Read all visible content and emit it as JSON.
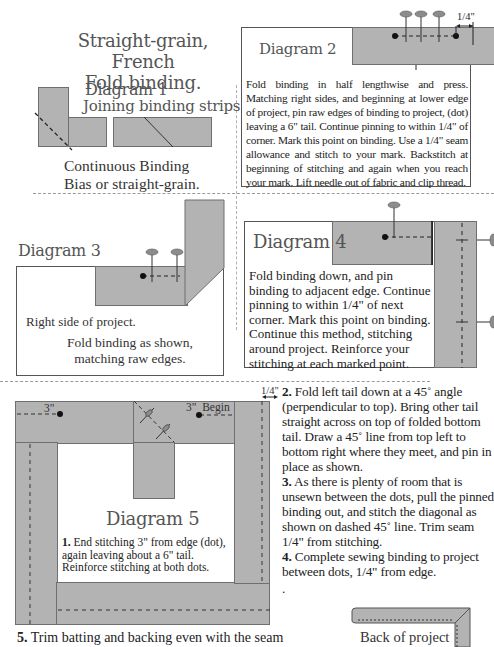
{
  "page": {
    "title_line1": "Straight-grain, French",
    "title_line2": "Fold  binding."
  },
  "diagram1": {
    "title": "Diagram 1",
    "subtitle": "Joining binding strips.",
    "caption_line1": "Continuous Binding",
    "caption_line2": "Bias or straight-grain."
  },
  "diagram2": {
    "title": "Diagram 2",
    "measure_label": "1/4\"",
    "text": "Fold binding in half lengthwise and press.  Matching right sides, and beginning at lower edge of project, pin raw edges of binding to project, (dot) leaving a 6\" tail.  Continue pinning to within 1/4\" of corner.  Mark this point on binding.  Use a 1/4\" seam allowance and stitch to your mark.  Backstitch at beginning of stitching and again when you reach your mark.  Lift needle out of fabric and clip thread."
  },
  "diagram3": {
    "title": "Diagram 3",
    "label_right_side": "Right side of project.",
    "caption_line1": "Fold binding as shown,",
    "caption_line2": "matching raw edges."
  },
  "diagram4": {
    "title": "Diagram 4",
    "text": "Fold binding down, and pin binding to adjacent edge.  Continue pinning to within 1/4\" of next corner.  Mark this point on binding.  Continue this method, stitching around project. Reinforce your stitching at each marked point."
  },
  "diagram5": {
    "title": "Diagram 5",
    "label_3in_left": "3\"",
    "label_3in_begin": "3\"  Begin",
    "label_quarter": "1/4\"",
    "step1_num": "1.",
    "step1_text": "End stitching 3\" from edge (dot), again leaving about a 6\" tail. Reinforce stitching at both dots."
  },
  "steps": {
    "step2_num": "2.",
    "step2_text": "Fold left tail down at a 45˚ angle (perpendicular to top).  Bring other tail straight across on top of folded bottom tail.  Draw a 45˚ line from top left to bottom right where they meet, and pin in place as shown.",
    "step3_num": "3.",
    "step3_text": "As there is plenty of room that is unsewn between the dots, pull the pinned binding out, and stitch the diagonal as shown on dashed 45˚ line.  Trim seam 1/4\" from stitching.",
    "step4_num": "4.",
    "step4_text": "Complete sewing binding to project between dots, 1/4\" from edge.",
    "stray_dot": ".",
    "step5_num": "5.",
    "step5_text": "Trim batting and backing even with the seam"
  },
  "back_diagram": {
    "label": "Back of project"
  },
  "colors": {
    "binding_gray": "#b3b3b3",
    "outline": "#555555",
    "pin_head": "#8c8c8c"
  }
}
